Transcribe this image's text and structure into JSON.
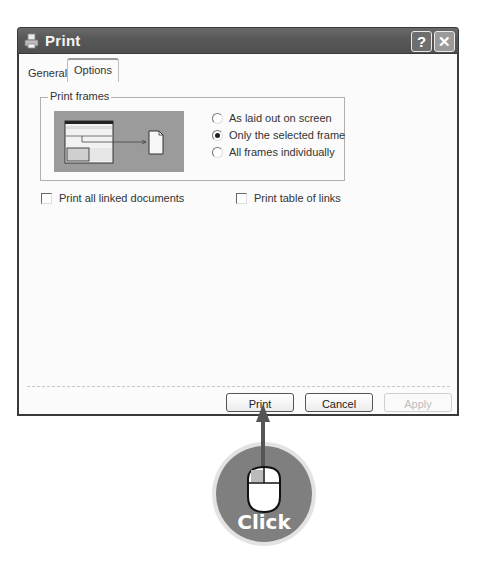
{
  "window": {
    "title": "Print",
    "title_icon": "printer-icon",
    "help_button": "?",
    "close_button": "✕"
  },
  "tabs": [
    {
      "label": "General",
      "active": false
    },
    {
      "label": "Options",
      "active": true
    }
  ],
  "print_frames": {
    "group_label": "Print frames",
    "preview_icon": "frames-preview-illustration",
    "options": [
      {
        "label": "As laid out on screen",
        "checked": false
      },
      {
        "label": "Only the selected frame",
        "checked": true
      },
      {
        "label": "All frames individually",
        "checked": false
      }
    ]
  },
  "checkboxes": [
    {
      "label": "Print all linked documents",
      "checked": false
    },
    {
      "label": "Print table of links",
      "checked": false
    }
  ],
  "buttons": {
    "print": "Print",
    "cancel": "Cancel",
    "apply": "Apply"
  },
  "callout": {
    "label": "Click",
    "icon": "mouse-icon",
    "colors": {
      "bubble": "#7f7f7f",
      "arrow": "#555555"
    }
  }
}
